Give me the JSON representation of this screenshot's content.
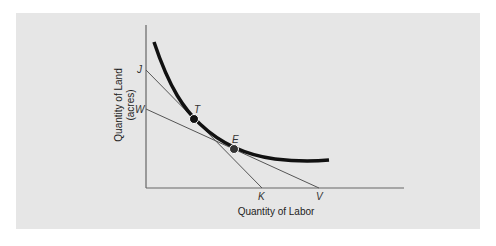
{
  "diagram": {
    "axes": {
      "x_label": "Quantity of Labor",
      "y_label_line1": "Quantity of Land",
      "y_label_line2": "(acres)"
    },
    "points": {
      "J": "J",
      "W": "W",
      "T": "T",
      "E": "E",
      "K": "K",
      "V": "V"
    },
    "elements": [
      {
        "type": "isoquant",
        "description": "thick convex curve"
      },
      {
        "type": "isocost",
        "from": "J",
        "to": "K",
        "tangent_at": "T"
      },
      {
        "type": "isocost",
        "from": "W",
        "to": "V",
        "tangent_at": "E"
      }
    ]
  }
}
